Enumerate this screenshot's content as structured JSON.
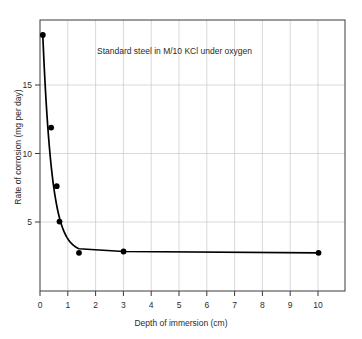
{
  "chart_data": {
    "type": "line",
    "title": "",
    "subtitle": "",
    "annotation": "Standard steel in M/10 KCl under oxygen",
    "xlabel": "Depth of immersion (cm)",
    "ylabel": "Rate of corrosion (mg per day)",
    "xlim": [
      0,
      10.95
    ],
    "ylim": [
      0,
      19.9
    ],
    "xticks": [
      0,
      1,
      2,
      3,
      4,
      5,
      6,
      7,
      8,
      9,
      10
    ],
    "xtick_labels": [
      "0",
      "1",
      "2",
      "3",
      "4",
      "5",
      "6",
      "7",
      "8",
      "9",
      "10"
    ],
    "yticks": [
      5,
      10,
      15
    ],
    "ytick_labels": [
      "5",
      "10",
      "15"
    ],
    "grid": "both",
    "legend": "none",
    "series": [
      {
        "name": "Rate of corrosion",
        "marker": "filled-circle",
        "x": [
          0.1,
          0.4,
          0.6,
          0.7,
          1.4,
          3.0,
          10.0
        ],
        "values": [
          18.8,
          12.0,
          7.7,
          5.1,
          2.8,
          2.9,
          2.8
        ]
      }
    ],
    "colors": {
      "line": "#000000",
      "marker": "#000000",
      "grid": "#c8c8c8",
      "axis": "#3a3a3a",
      "background": "#ffffff"
    }
  }
}
